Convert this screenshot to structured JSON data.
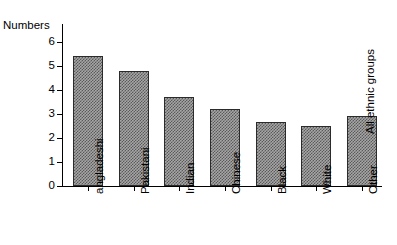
{
  "figure": {
    "title_remnant": "· · · ·  · · · · · ·",
    "annotation": "All ethnic groups",
    "background_color": "#ffffff",
    "bar_fill_color": "#a6a6a6",
    "bar_pattern_color": "#5a5a5a",
    "bar_outline_color": "#2b2b2b",
    "axis_color": "#000000"
  },
  "chart_data": {
    "type": "bar",
    "title": "",
    "xlabel": "",
    "ylabel": "Numbers",
    "ylim": [
      0,
      6.4
    ],
    "yticks": [
      0,
      1,
      2,
      3,
      4,
      5,
      6
    ],
    "ytick_labels": [
      "0",
      "1",
      "2",
      "3",
      "4",
      "5",
      "6"
    ],
    "grid": false,
    "legend": false,
    "categories": [
      "angladeshi",
      "Pakistani",
      "Indian",
      "Chinese",
      "Black",
      "White",
      "Other"
    ],
    "values": [
      5.4,
      4.8,
      3.7,
      3.2,
      2.65,
      2.5,
      2.9
    ],
    "annotations": [
      {
        "text": "All ethnic groups",
        "near_category": "Other"
      }
    ]
  }
}
